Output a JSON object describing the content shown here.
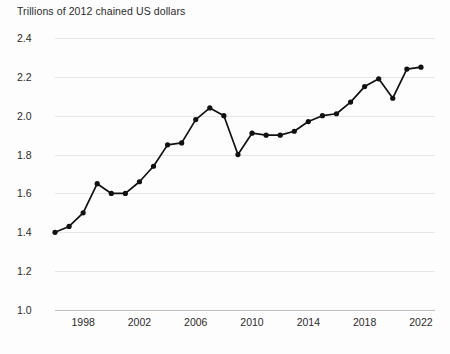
{
  "chart_data": {
    "type": "line",
    "title": "Trillions of 2012 chained US dollars",
    "subtitle": "",
    "xlabel": "",
    "ylabel": "",
    "ylim": [
      1.0,
      2.4
    ],
    "xlim": [
      1996,
      2023
    ],
    "grid": true,
    "legend": "none",
    "markers": true,
    "line_color": "#111111",
    "marker_color": "#111111",
    "grid_color": "#e6e6e6",
    "background_color": "#fdfdfd",
    "text_color": "#2b2b2b",
    "y_ticks": [
      "2.4",
      "2.2",
      "2.0",
      "1.8",
      "1.6",
      "1.4",
      "1.2",
      "1.0"
    ],
    "y_tick_values": [
      2.4,
      2.2,
      2.0,
      1.8,
      1.6,
      1.4,
      1.2,
      1.0
    ],
    "x_ticks": [
      "1998",
      "2002",
      "2006",
      "2010",
      "2014",
      "2018",
      "2022"
    ],
    "x_tick_values": [
      1998,
      2002,
      2006,
      2010,
      2014,
      2018,
      2022
    ],
    "x": [
      1996,
      1997,
      1998,
      1999,
      2000,
      2001,
      2002,
      2003,
      2004,
      2005,
      2006,
      2007,
      2008,
      2009,
      2010,
      2011,
      2012,
      2013,
      2014,
      2015,
      2016,
      2017,
      2018,
      2019,
      2020,
      2021,
      2022
    ],
    "values": [
      1.4,
      1.43,
      1.5,
      1.65,
      1.6,
      1.6,
      1.66,
      1.74,
      1.85,
      1.86,
      1.98,
      2.04,
      2.0,
      1.8,
      1.91,
      1.9,
      1.9,
      1.92,
      1.97,
      2.0,
      2.01,
      2.07,
      2.15,
      2.19,
      2.09,
      2.24,
      2.25
    ],
    "series": [
      {
        "name": "Trillions of 2012 chained US dollars",
        "values": [
          1.4,
          1.43,
          1.5,
          1.65,
          1.6,
          1.6,
          1.66,
          1.74,
          1.85,
          1.86,
          1.98,
          2.04,
          2.0,
          1.8,
          1.91,
          1.9,
          1.9,
          1.92,
          1.97,
          2.0,
          2.01,
          2.07,
          2.15,
          2.19,
          2.09,
          2.24,
          2.25
        ]
      }
    ]
  }
}
